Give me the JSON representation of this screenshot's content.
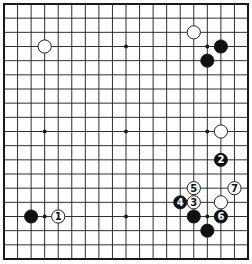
{
  "board": {
    "size": 19,
    "grid": {
      "x0": 4,
      "y0": 4,
      "x1": 248,
      "y1": 259
    },
    "colors": {
      "line": "#1a1a1a",
      "black_stone": "#111111",
      "white_stone": "#ffffff",
      "background": "#ffffff"
    },
    "star_points": [
      [
        3,
        3
      ],
      [
        9,
        3
      ],
      [
        15,
        3
      ],
      [
        3,
        9
      ],
      [
        9,
        9
      ],
      [
        15,
        9
      ],
      [
        3,
        15
      ],
      [
        9,
        15
      ],
      [
        15,
        15
      ]
    ],
    "stones": [
      {
        "color": "white",
        "col": 3,
        "row": 3,
        "label": ""
      },
      {
        "color": "white",
        "col": 14,
        "row": 2,
        "label": ""
      },
      {
        "color": "black",
        "col": 16,
        "row": 3,
        "label": ""
      },
      {
        "color": "black",
        "col": 15,
        "row": 4,
        "label": ""
      },
      {
        "color": "white",
        "col": 16,
        "row": 9,
        "label": ""
      },
      {
        "color": "black",
        "col": 16,
        "row": 11,
        "label": "2"
      },
      {
        "color": "white",
        "col": 14,
        "row": 13,
        "label": "5"
      },
      {
        "color": "white",
        "col": 17,
        "row": 13,
        "label": "7"
      },
      {
        "color": "black",
        "col": 13,
        "row": 14,
        "label": "4"
      },
      {
        "color": "white",
        "col": 14,
        "row": 14,
        "label": "3"
      },
      {
        "color": "white",
        "col": 16,
        "row": 14,
        "label": ""
      },
      {
        "color": "black",
        "col": 14,
        "row": 15,
        "label": ""
      },
      {
        "color": "black",
        "col": 16,
        "row": 15,
        "label": "6"
      },
      {
        "color": "black",
        "col": 15,
        "row": 16,
        "label": ""
      },
      {
        "color": "black",
        "col": 2,
        "row": 15,
        "label": ""
      },
      {
        "color": "white",
        "col": 4,
        "row": 15,
        "label": "1"
      }
    ]
  }
}
